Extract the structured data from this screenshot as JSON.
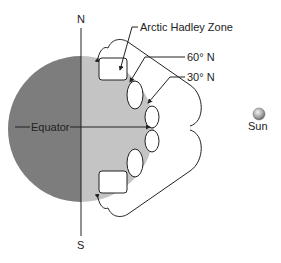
{
  "diagram": {
    "axis_labels": {
      "north": "N",
      "south": "S"
    },
    "equator_label": "Equator",
    "callouts": {
      "arctic_hadley_zone": "Arctic Hadley Zone",
      "lat_60": "60° N",
      "lat_30": "30° N"
    },
    "sun_label": "Sun",
    "colors": {
      "night_side": "#7d7d7d",
      "day_side": "#c4c4c4",
      "line": "#222222",
      "sun": "#a0a0a0"
    }
  }
}
